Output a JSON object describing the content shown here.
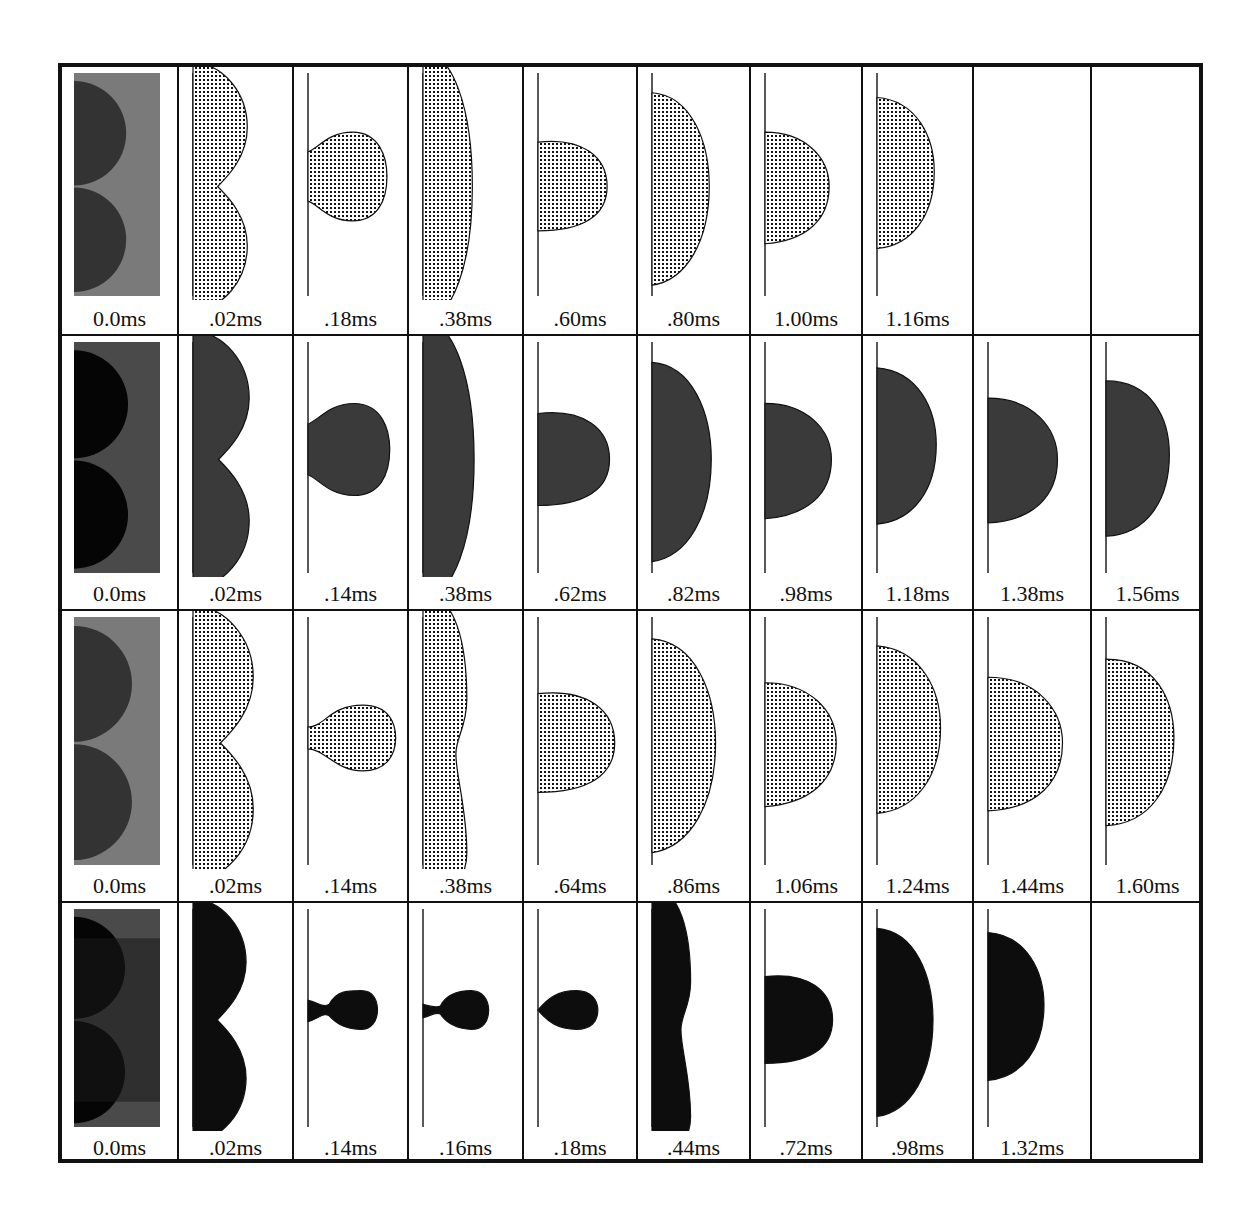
{
  "figure": {
    "colors": {
      "border": "#111111",
      "drop_light": "#9a9a9a",
      "drop_dark": "#3a3a3a",
      "drop_black": "#111111",
      "background": "#ffffff"
    },
    "rows": [
      {
        "series": 1,
        "shade": "light",
        "frames": [
          {
            "time": "0.0ms",
            "shape": "initial"
          },
          {
            "time": ".02ms",
            "shape": "twin"
          },
          {
            "time": ".18ms",
            "shape": "bulb_neck"
          },
          {
            "time": ".38ms",
            "shape": "tall"
          },
          {
            "time": ".60ms",
            "shape": "small_cap"
          },
          {
            "time": ".80ms",
            "shape": "mid_cap"
          },
          {
            "time": "1.00ms",
            "shape": "small_cap2"
          },
          {
            "time": "1.16ms",
            "shape": "mid_cap2"
          },
          {
            "time": "",
            "shape": "empty"
          },
          {
            "time": "",
            "shape": "empty"
          }
        ]
      },
      {
        "series": 2,
        "shade": "dark",
        "frames": [
          {
            "time": "0.0ms",
            "shape": "initial"
          },
          {
            "time": ".02ms",
            "shape": "twin"
          },
          {
            "time": ".14ms",
            "shape": "bulb_neck"
          },
          {
            "time": ".38ms",
            "shape": "tall"
          },
          {
            "time": ".62ms",
            "shape": "small_cap"
          },
          {
            "time": ".82ms",
            "shape": "mid_cap"
          },
          {
            "time": ".98ms",
            "shape": "small_cap2"
          },
          {
            "time": "1.18ms",
            "shape": "mid_cap2"
          },
          {
            "time": "1.38ms",
            "shape": "small_cap3"
          },
          {
            "time": "1.56ms",
            "shape": "mid_cap3"
          }
        ]
      },
      {
        "series": 3,
        "shade": "light",
        "frames": [
          {
            "time": "0.0ms",
            "shape": "initial"
          },
          {
            "time": ".02ms",
            "shape": "twin"
          },
          {
            "time": ".14ms",
            "shape": "bulb_thin_neck"
          },
          {
            "time": ".38ms",
            "shape": "tall_waist"
          },
          {
            "time": ".64ms",
            "shape": "small_cap"
          },
          {
            "time": ".86ms",
            "shape": "mid_cap"
          },
          {
            "time": "1.06ms",
            "shape": "small_cap2"
          },
          {
            "time": "1.24ms",
            "shape": "mid_cap2"
          },
          {
            "time": "1.44ms",
            "shape": "small_cap3"
          },
          {
            "time": "1.60ms",
            "shape": "mid_cap3"
          }
        ]
      },
      {
        "series": 4,
        "shade": "black",
        "frames": [
          {
            "time": "0.0ms",
            "shape": "initial"
          },
          {
            "time": ".02ms",
            "shape": "twin"
          },
          {
            "time": ".14ms",
            "shape": "pinch"
          },
          {
            "time": ".16ms",
            "shape": "pinch2"
          },
          {
            "time": ".18ms",
            "shape": "teardrop"
          },
          {
            "time": ".44ms",
            "shape": "tall_waist"
          },
          {
            "time": ".72ms",
            "shape": "small_cap"
          },
          {
            "time": ".98ms",
            "shape": "mid_cap"
          },
          {
            "time": "1.32ms",
            "shape": "mid_cap2"
          },
          {
            "time": "",
            "shape": "empty"
          }
        ]
      }
    ]
  }
}
